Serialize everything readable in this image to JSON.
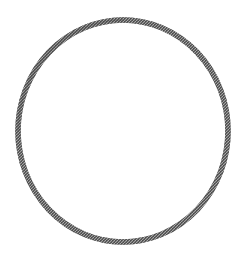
{
  "image": {
    "title": "Circle outline line drawing",
    "description": "A single large hand-drawn circle outline, slightly elliptical, rendered as a grainy gray halftone stroke on a plain white background. The interior of the circle is empty white.",
    "background_color": "#ffffff",
    "width": 243,
    "height": 267
  },
  "shapes": [
    {
      "name": "circle-outline",
      "type": "ellipse",
      "center_x": 123,
      "center_y": 131,
      "radius_x": 105,
      "radius_y": 111,
      "stroke_color": "#6b6b6b",
      "stroke_color_dark": "#4a4a4a",
      "stroke_width": 5.5,
      "fill": "none",
      "texture": "grainy-halftone",
      "bounds": {
        "left": 18,
        "top": 20,
        "right": 228,
        "bottom": 242
      }
    }
  ],
  "caption": ""
}
